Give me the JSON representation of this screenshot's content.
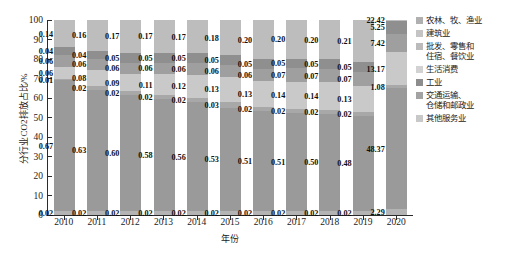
{
  "chart_data": {
    "type": "bar",
    "stacked": true,
    "title": "",
    "xlabel": "年份",
    "ylabel": "分行业CO2排放占比/%",
    "ylim": [
      0,
      100
    ],
    "yticks": [
      "0",
      "10",
      "20",
      "30",
      "40",
      "50",
      "60",
      "70",
      "80",
      "90",
      "100"
    ],
    "grid": false,
    "legend_position": "right",
    "categories": [
      "2010",
      "2011",
      "2012",
      "2013",
      "2014",
      "2015",
      "2016",
      "2017",
      "2018",
      "2019",
      "2020"
    ],
    "series": [
      {
        "name": "农林、牧、渔业",
        "color": "#b4b4b4",
        "values": [
          0.02,
          0.02,
          0.02,
          0.02,
          0.02,
          0.02,
          0.02,
          0.02,
          0.02,
          0.02,
          2.29
        ],
        "labels": [
          "0.02",
          "0.02",
          "0.02",
          "0.02",
          "0.02",
          "0.02",
          "0.02",
          "0.02",
          "0.02",
          "0.02",
          "2.29"
        ]
      },
      {
        "name": "建筑业",
        "color": "#9a9a9a",
        "values": [
          0.67,
          0.63,
          0.6,
          0.58,
          0.56,
          0.53,
          0.51,
          0.51,
          0.5,
          0.48,
          48.37
        ],
        "labels": [
          "0.67",
          "0.63",
          "0.60",
          "0.58",
          "0.56",
          "0.53",
          "0.51",
          "0.51",
          "0.50",
          "0.48",
          "48.37"
        ]
      },
      {
        "name": "批发、零售和\n住宿、餐饮业",
        "color": "#a8a8a8",
        "values": [
          0.01,
          0.02,
          0.02,
          0.02,
          0.02,
          0.03,
          0.02,
          0.02,
          0.02,
          0.02,
          1.08
        ],
        "labels": [
          "0.01",
          "0.02",
          "0.02",
          "0.02",
          "0.02",
          "0.03",
          "0.02",
          "0.02",
          "0.02",
          "0.02",
          "1.08"
        ]
      },
      {
        "name": "生活消费",
        "color": "#c9c9c9",
        "values": [
          0.06,
          0.08,
          0.09,
          0.11,
          0.12,
          0.13,
          0.13,
          0.14,
          0.14,
          0.13,
          13.17
        ],
        "labels": [
          "0.06",
          "0.08",
          "0.09",
          "0.11",
          "0.12",
          "0.13",
          "0.13",
          "0.14",
          "0.14",
          "0.13",
          "13.17"
        ]
      },
      {
        "name": "工业",
        "color": "#9f9f9f",
        "values": [
          0.06,
          0.06,
          0.06,
          0.06,
          0.06,
          0.06,
          0.06,
          0.07,
          0.07,
          0.07,
          7.42
        ],
        "labels": [
          "0.06",
          "0.06",
          "0.06",
          "0.06",
          "0.06",
          "0.06",
          "0.06",
          "0.07",
          "0.07",
          "0.07",
          "7.42"
        ]
      },
      {
        "name": "交通运输、\n仓储和邮政业",
        "color": "#8f8f8f",
        "values": [
          0.04,
          0.04,
          0.05,
          0.05,
          0.05,
          0.05,
          0.05,
          0.05,
          0.05,
          0.05,
          5.25
        ],
        "labels": [
          "0.04",
          "0.04",
          "0.05",
          "0.05",
          "0.05",
          "0.05",
          "0.05",
          "0.05",
          "0.05",
          "0.05",
          "5.25"
        ]
      },
      {
        "name": "其他服务业",
        "color": "#bdbdbd",
        "values": [
          0.14,
          0.16,
          0.17,
          0.17,
          0.17,
          0.18,
          0.2,
          0.2,
          0.2,
          0.21,
          0.22
        ],
        "labels": [
          "0.14",
          "0.16",
          "0.17",
          "0.17",
          "0.17",
          "0.18",
          "0.20",
          "0.20",
          "0.20",
          "0.21",
          "22.42"
        ]
      }
    ]
  },
  "legend": {
    "items": [
      {
        "label": "农林、牧、渔业",
        "color": "#b0b0b0"
      },
      {
        "label": "建筑业",
        "color": "#c4c4c4"
      },
      {
        "label": "批发、零售和\n住宿、餐饮业",
        "color": "#bbbbbb"
      },
      {
        "label": "生活消费",
        "color": "#d2d2d2"
      },
      {
        "label": "工业",
        "color": "#8d8d8d"
      },
      {
        "label": "交通运输、\n仓储和邮政业",
        "color": "#a3a3a3"
      },
      {
        "label": "其他服务业",
        "color": "#c8c8c8"
      }
    ]
  }
}
